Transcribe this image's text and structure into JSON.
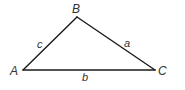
{
  "diagram": {
    "type": "triangle",
    "stroke_color": "#1a1a1a",
    "label_color": "#333333",
    "vertices": [
      {
        "label": "A",
        "x": 23,
        "y": 70
      },
      {
        "label": "B",
        "x": 77,
        "y": 17
      },
      {
        "label": "C",
        "x": 155,
        "y": 70
      }
    ],
    "sides": [
      {
        "label": "c",
        "from": "A",
        "to": "B"
      },
      {
        "label": "a",
        "from": "B",
        "to": "C"
      },
      {
        "label": "b",
        "from": "A",
        "to": "C"
      }
    ]
  }
}
